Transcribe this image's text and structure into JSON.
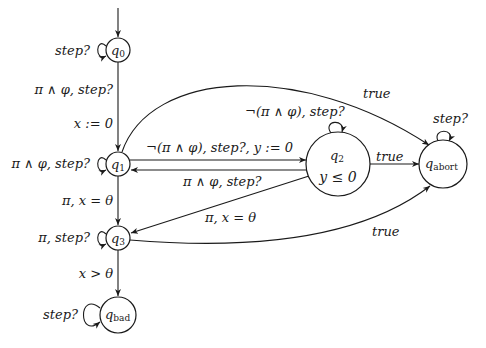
{
  "diagram": {
    "type": "timed-automaton",
    "nodes": [
      {
        "id": "q0",
        "label": "q",
        "sub": "0",
        "initial": true
      },
      {
        "id": "q1",
        "label": "q",
        "sub": "1"
      },
      {
        "id": "q2",
        "label": "q",
        "sub": "2",
        "invariant": "y ≤ 0"
      },
      {
        "id": "q3",
        "label": "q",
        "sub": "3"
      },
      {
        "id": "qabort",
        "label": "q",
        "sub": "abort"
      },
      {
        "id": "qbad",
        "label": "q",
        "sub": "bad"
      }
    ],
    "edges": [
      {
        "from": "q0",
        "to": "q0",
        "label": "step?"
      },
      {
        "from": "q0",
        "to": "q1",
        "label": "π ∧ φ, step?",
        "label2": "x := 0"
      },
      {
        "from": "q1",
        "to": "q1",
        "label": "π ∧ φ, step?"
      },
      {
        "from": "q1",
        "to": "q2",
        "label": "¬(π ∧ φ), step?, y := 0"
      },
      {
        "from": "q2",
        "to": "q1",
        "label": "π ∧ φ, step?"
      },
      {
        "from": "q2",
        "to": "q2",
        "label": "¬(π ∧ φ), step?"
      },
      {
        "from": "q1",
        "to": "qabort",
        "label": "true"
      },
      {
        "from": "q2",
        "to": "qabort",
        "label": "true"
      },
      {
        "from": "q1",
        "to": "q3",
        "label": "π, x = θ"
      },
      {
        "from": "q2",
        "to": "q3",
        "label": "π, x = θ"
      },
      {
        "from": "q3",
        "to": "q3",
        "label": "π, step?"
      },
      {
        "from": "q3",
        "to": "qabort",
        "label": "true"
      },
      {
        "from": "q3",
        "to": "qbad",
        "label": "x > θ"
      },
      {
        "from": "qabort",
        "to": "qabort",
        "label": "step?"
      },
      {
        "from": "qbad",
        "to": "qbad",
        "label": "step?"
      }
    ]
  },
  "labels": {
    "q0_self": "step?",
    "q0_q1_a": "π ∧ φ, step?",
    "q0_q1_b": "x := 0",
    "q1_self": "π ∧ φ, step?",
    "q1_q2": "¬(π ∧ φ), step?, y := 0",
    "q2_q1": "π ∧ φ, step?",
    "q2_self": "¬(π ∧ φ), step?",
    "q1_abort": "true",
    "q2_abort": "true",
    "q1_q3": "π, x = θ",
    "q2_q3": "π, x = θ",
    "q3_self": "π, step?",
    "q3_abort": "true",
    "q3_bad": "x > θ",
    "abort_self": "step?",
    "bad_self": "step?",
    "q2_inv": "y ≤ 0"
  },
  "nodes": {
    "q0": {
      "base": "q",
      "sub": "0"
    },
    "q1": {
      "base": "q",
      "sub": "1"
    },
    "q2": {
      "base": "q",
      "sub": "2"
    },
    "q3": {
      "base": "q",
      "sub": "3"
    },
    "qabort": {
      "base": "q",
      "sub": "abort"
    },
    "qbad": {
      "base": "q",
      "sub": "bad"
    }
  }
}
